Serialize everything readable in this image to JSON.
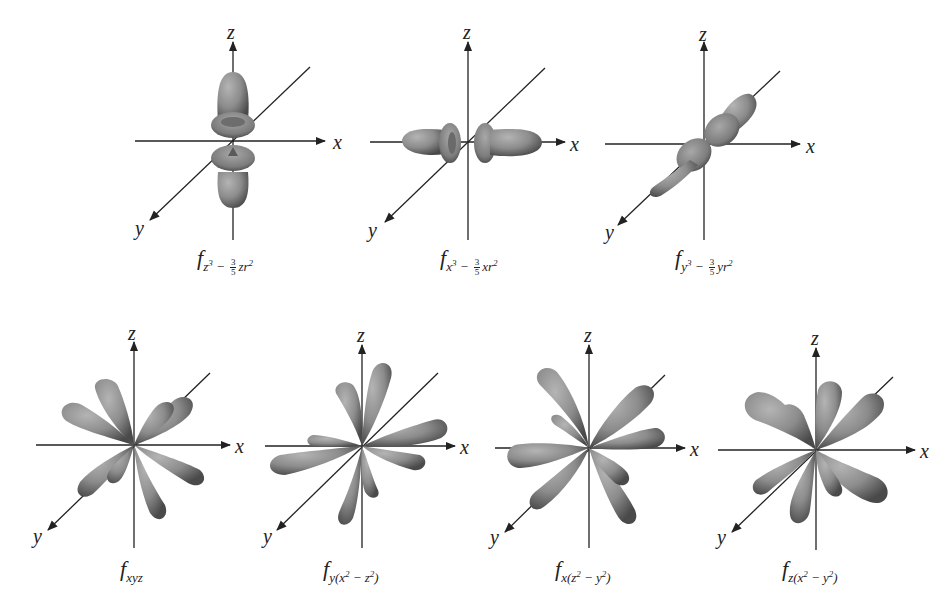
{
  "figure": {
    "title": "",
    "lobe_color": "#8a8a8a",
    "axis_color": "#222222",
    "axes_labels": {
      "x": "x",
      "y": "y",
      "z": "z"
    }
  },
  "orbitals": [
    {
      "id": "f_z3",
      "letter": "f",
      "subscript_main": "z",
      "sup": "3",
      "minus": "−",
      "frac_num": "3",
      "frac_den": "5",
      "tail": "zr",
      "tail_sup": "2",
      "row": 1
    },
    {
      "id": "f_x3",
      "letter": "f",
      "subscript_main": "x",
      "sup": "3",
      "minus": "−",
      "frac_num": "3",
      "frac_den": "5",
      "tail": "xr",
      "tail_sup": "2",
      "row": 1
    },
    {
      "id": "f_y3",
      "letter": "f",
      "subscript_main": "y",
      "sup": "3",
      "minus": "−",
      "frac_num": "3",
      "frac_den": "5",
      "tail": "yr",
      "tail_sup": "2",
      "row": 1
    },
    {
      "id": "f_xyz",
      "letter": "f",
      "subscript": "xyz",
      "row": 2
    },
    {
      "id": "f_y_x2_z2",
      "letter": "f",
      "sub_a": "y(x",
      "sup_a": "2",
      "sub_b": " − z",
      "sup_b": "2",
      "sub_c": ")",
      "row": 2
    },
    {
      "id": "f_x_z2_y2",
      "letter": "f",
      "sub_a": "x(z",
      "sup_a": "2",
      "sub_b": " − y",
      "sup_b": "2",
      "sub_c": ")",
      "row": 2
    },
    {
      "id": "f_z_x2_y2",
      "letter": "f",
      "sub_a": "z(x",
      "sup_a": "2",
      "sub_b": " − y",
      "sup_b": "2",
      "sub_c": ")",
      "row": 2
    }
  ]
}
